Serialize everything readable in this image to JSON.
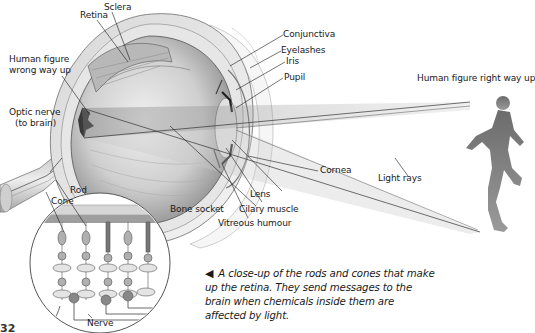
{
  "diagram": {
    "labels": {
      "sclera": "Sclera",
      "retina": "Retina",
      "human_figure_wrong": [
        "Human figure",
        "wrong way up"
      ],
      "optic_nerve": [
        "Optic nerve",
        "(to brain)"
      ],
      "conjunctiva": "Conjunctiva",
      "eyelashes": "Eyelashes",
      "iris": "Iris",
      "pupil": "Pupil",
      "human_figure_right": "Human figure right way up",
      "cornea": "Cornea",
      "light_rays": "Light rays",
      "lens": "Lens",
      "cilary_muscle": "Cilary muscle",
      "bone_socket": "Bone socket",
      "vitreous_humour": "Vitreous humour",
      "rod": "Rod",
      "cone": "Cone",
      "nerve": "Nerve"
    },
    "caption": {
      "arrow": "◀",
      "text": "A close-up of the rods and cones that make up the retina. They send messages to the brain when chemicals inside them are affected by light."
    },
    "page_mark": "32",
    "colors": {
      "line": "#1a1a1a",
      "eye_shade": "#9a9a9a",
      "eye_light": "#e2e2e2",
      "ray": "#8a8a8a"
    }
  }
}
